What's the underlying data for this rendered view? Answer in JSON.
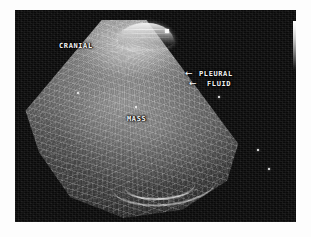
{
  "image": {
    "modality": "ultrasound",
    "view": "sector-scan",
    "background_color": "#ffffff",
    "frame_color": "#0a0a0a"
  },
  "annotations": {
    "cranial": "CRANIAL",
    "mass": "MASS",
    "pleural": "PLEURAL",
    "fluid": "FLUID",
    "arrow_glyph": "←"
  },
  "markers": {
    "apex_marker": "probe-apex-marker",
    "depth_dots": 5
  },
  "calibration": {
    "wedge_label": "grayscale-wedge",
    "top_color": "#ffffff",
    "bottom_color": "#101010"
  }
}
